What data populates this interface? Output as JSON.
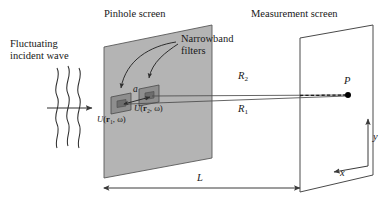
{
  "figure": {
    "type": "optics-schematic"
  },
  "labels": {
    "incident_wave_line1": "Fluctuating",
    "incident_wave_line2": "incident wave",
    "pinhole_screen": "Pinhole screen",
    "narrowband_line1": "Narrowband",
    "narrowband_line2": "filters",
    "measurement_screen": "Measurement screen",
    "separation": "a",
    "field_1": "U(r₁, ω)",
    "field_2": "U(r₂, ω)",
    "field_1_fn": "U",
    "field_1_arg": "r",
    "field_1_sub": "1",
    "field_1_omega": "ω",
    "field_2_fn": "U",
    "field_2_arg": "r",
    "field_2_sub": "2",
    "field_2_omega": "ω",
    "distance_R1": "R",
    "distance_R1_sub": "1",
    "distance_R2": "R",
    "distance_R2_sub": "2",
    "point_P": "P",
    "axis_x": "x",
    "axis_y": "y",
    "distance_L": "L"
  },
  "colors": {
    "screen_fill": "#b4b4b4",
    "pinhole_fill": "#8e8e8e",
    "stroke": "#3a3a3a",
    "text": "#181818",
    "background": "#ffffff",
    "point_fill": "#000000"
  },
  "geometry": {
    "pinhole_screen_quad": "104,47 212,25 212,158 104,178",
    "measurement_screen_quad": "300,38 373,25 373,175 300,192",
    "pinhole_1": {
      "x": 120,
      "y": 103
    },
    "pinhole_2": {
      "x": 147,
      "y": 94
    },
    "point_P": {
      "x": 348,
      "y": 95
    },
    "L_arrow_y": 188,
    "L_from_x": 104,
    "L_to_x": 300
  }
}
